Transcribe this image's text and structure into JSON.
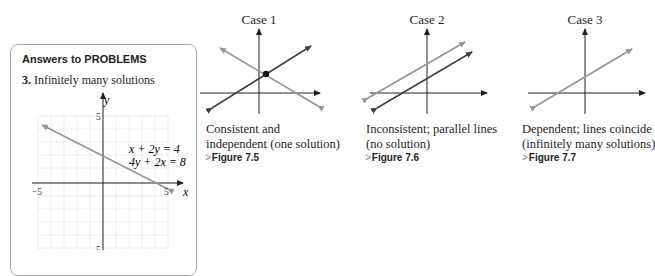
{
  "answers_panel": {
    "title": "Answers to PROBLEMS",
    "problem_number": "3.",
    "answer_text": "Infinitely many solutions",
    "graph": {
      "x_label": "x",
      "y_label": "y",
      "x_min_label": "−5",
      "x_max_label": "5",
      "y_max_label": "5",
      "y_min_label": "5",
      "equation_1": "x + 2y = 4",
      "equation_2": "4y + 2x = 8"
    }
  },
  "cases": [
    {
      "title": "Case 1",
      "caption_line1": "Consistent and",
      "caption_line2": "independent (one solution)",
      "figure_ref": "Figure 7.5"
    },
    {
      "title": "Case 2",
      "caption_line1": "Inconsistent; parallel lines",
      "caption_line2": "(no solution)",
      "figure_ref": "Figure 7.6"
    },
    {
      "title": "Case 3",
      "caption_line1": "Dependent; lines coincide",
      "caption_line2": "(infinitely many solutions)",
      "figure_ref": "Figure 7.7"
    }
  ],
  "figref_marker": ">",
  "colors": {
    "axis": "#231f20",
    "line_gray": "#939598",
    "line_dark": "#414042",
    "grid": "#e6e7e8",
    "panel_border": "#a7a9ac"
  }
}
